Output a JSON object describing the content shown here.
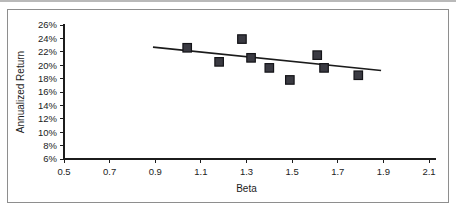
{
  "chart_data": {
    "type": "scatter",
    "title": "",
    "xlabel": "Beta",
    "ylabel": "Annualized Return",
    "xlim": [
      0.5,
      2.1
    ],
    "ylim": [
      6,
      26
    ],
    "xticks": [
      0.5,
      0.7,
      0.9,
      1.1,
      1.3,
      1.5,
      1.7,
      1.9,
      2.1
    ],
    "xtick_labels": [
      "0.5",
      "0.7",
      "0.9",
      "1.1",
      "1.3",
      "1.5",
      "1.7",
      "1.9",
      "2.1"
    ],
    "yticks": [
      6,
      8,
      10,
      12,
      14,
      16,
      18,
      20,
      22,
      24,
      26
    ],
    "ytick_labels": [
      "6%",
      "8%",
      "10%",
      "12%",
      "14%",
      "16%",
      "18%",
      "20%",
      "22%",
      "24%",
      "26%"
    ],
    "grid": false,
    "legend": false,
    "marker_shape": "square",
    "marker_color": "#3a3a42",
    "points": [
      {
        "x": 1.04,
        "y": 22.6
      },
      {
        "x": 1.18,
        "y": 20.5
      },
      {
        "x": 1.28,
        "y": 23.9
      },
      {
        "x": 1.32,
        "y": 21.1
      },
      {
        "x": 1.4,
        "y": 19.6
      },
      {
        "x": 1.49,
        "y": 17.8
      },
      {
        "x": 1.61,
        "y": 21.5
      },
      {
        "x": 1.64,
        "y": 19.6
      },
      {
        "x": 1.79,
        "y": 18.5
      }
    ],
    "trendline": {
      "type": "linear",
      "color": "#1b1b1b",
      "x_start": 0.89,
      "y_start": 22.7,
      "x_end": 1.89,
      "y_end": 19.2
    }
  },
  "colors": {
    "frame_border": "#8e8e8e",
    "axis": "#1c1c1c",
    "background": "#ffffff"
  }
}
